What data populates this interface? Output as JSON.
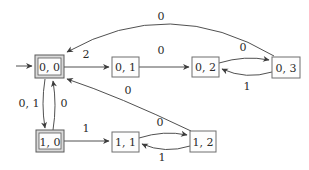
{
  "diagram": {
    "type": "finite-state-automaton",
    "colors": {
      "line": "#3c3c3c",
      "box_border": "#6e6e6e",
      "accepting_band": "#d9d9d9",
      "text": "#2b2b2b",
      "background": "#ffffff"
    },
    "states": [
      {
        "id": "q00",
        "label": "0, 0",
        "accepting": true,
        "initial": true
      },
      {
        "id": "q01",
        "label": "0, 1",
        "accepting": false,
        "initial": false
      },
      {
        "id": "q02",
        "label": "0, 2",
        "accepting": false,
        "initial": false
      },
      {
        "id": "q03",
        "label": "0, 3",
        "accepting": false,
        "initial": false
      },
      {
        "id": "q10",
        "label": "1, 0",
        "accepting": true,
        "initial": false
      },
      {
        "id": "q11",
        "label": "1, 1",
        "accepting": false,
        "initial": false
      },
      {
        "id": "q12",
        "label": "1, 2",
        "accepting": false,
        "initial": false
      }
    ],
    "transitions": [
      {
        "from": "0, 0",
        "to": "0, 1",
        "label": "2"
      },
      {
        "from": "0, 1",
        "to": "0, 2",
        "label": "0"
      },
      {
        "from": "0, 2",
        "to": "0, 3",
        "label": "0"
      },
      {
        "from": "0, 3",
        "to": "0, 2",
        "label": "1"
      },
      {
        "from": "0, 3",
        "to": "0, 0",
        "label": "0"
      },
      {
        "from": "0, 0",
        "to": "1, 0",
        "label": "0, 1"
      },
      {
        "from": "1, 0",
        "to": "0, 0",
        "label": "0"
      },
      {
        "from": "1, 0",
        "to": "1, 1",
        "label": "1"
      },
      {
        "from": "1, 1",
        "to": "1, 2",
        "label": "0"
      },
      {
        "from": "1, 2",
        "to": "1, 1",
        "label": "1"
      },
      {
        "from": "1, 2",
        "to": "0, 0",
        "label": "0"
      }
    ]
  }
}
